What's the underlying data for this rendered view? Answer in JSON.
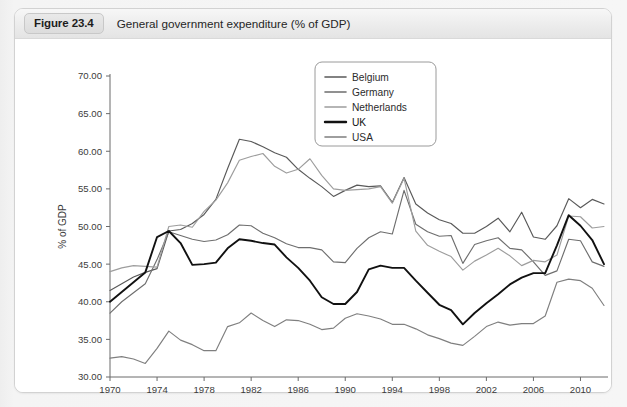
{
  "figure": {
    "number_label": "Figure 23.4",
    "title": "General government expenditure (% of GDP)"
  },
  "chart_data": {
    "type": "line",
    "title": "General government expenditure (% of GDP)",
    "xlabel": "",
    "ylabel": "% of GDP",
    "ylim": [
      30.0,
      70.0
    ],
    "xlim": [
      1970,
      2012
    ],
    "ytick_step": 5.0,
    "ytick_labels": [
      "30.00",
      "35.00",
      "40.00",
      "45.00",
      "50.00",
      "55.00",
      "60.00",
      "65.00",
      "70.00"
    ],
    "xtick_labels": [
      "1970",
      "1974",
      "1978",
      "1982",
      "1986",
      "1990",
      "1994",
      "1998",
      "2002",
      "2006",
      "2010"
    ],
    "xticks": [
      1970,
      1974,
      1978,
      1982,
      1986,
      1990,
      1994,
      1998,
      2002,
      2006,
      2010
    ],
    "grid": false,
    "legend_position": "top-right",
    "x": [
      1970,
      1971,
      1972,
      1973,
      1974,
      1975,
      1976,
      1977,
      1978,
      1979,
      1980,
      1981,
      1982,
      1983,
      1984,
      1985,
      1986,
      1987,
      1988,
      1989,
      1990,
      1991,
      1992,
      1993,
      1994,
      1995,
      1996,
      1997,
      1998,
      1999,
      2000,
      2001,
      2002,
      2003,
      2004,
      2005,
      2006,
      2007,
      2008,
      2009,
      2010,
      2011,
      2012
    ],
    "series": [
      {
        "name": "Belgium",
        "color": "#595959",
        "width": 1.15,
        "values": [
          41.5,
          42.4,
          43.3,
          43.9,
          44.4,
          49.4,
          49.6,
          50.4,
          51.6,
          53.6,
          57.7,
          61.6,
          61.3,
          60.6,
          59.8,
          59.2,
          57.6,
          56.4,
          55.3,
          54.0,
          54.8,
          55.5,
          55.3,
          55.4,
          53.2,
          56.5,
          53.0,
          51.8,
          50.9,
          50.4,
          49.1,
          49.1,
          50.0,
          51.1,
          49.3,
          51.9,
          48.6,
          48.3,
          50.1,
          53.7,
          52.5,
          53.6,
          53.0
        ]
      },
      {
        "name": "Germany",
        "color": "#6e6e6e",
        "width": 1.15,
        "values": [
          38.5,
          40.0,
          41.2,
          42.4,
          45.6,
          49.3,
          48.8,
          48.3,
          48.0,
          48.2,
          48.9,
          50.2,
          50.1,
          49.1,
          48.5,
          47.7,
          47.2,
          47.2,
          46.9,
          45.3,
          45.2,
          47.1,
          48.5,
          49.3,
          49.0,
          54.8,
          50.3,
          49.3,
          48.7,
          48.8,
          45.1,
          47.6,
          48.1,
          48.5,
          47.1,
          46.9,
          45.3,
          43.5,
          44.1,
          48.3,
          48.1,
          45.3,
          44.7
        ]
      },
      {
        "name": "Netherlands",
        "color": "#9d9d9d",
        "width": 1.15,
        "values": [
          44.0,
          44.5,
          44.8,
          44.7,
          44.6,
          50.0,
          50.2,
          49.9,
          52.0,
          53.5,
          55.8,
          58.8,
          59.3,
          59.7,
          58.0,
          57.1,
          57.6,
          59.0,
          56.8,
          55.0,
          54.8,
          54.9,
          55.0,
          55.3,
          53.1,
          56.4,
          49.4,
          47.5,
          46.7,
          46.0,
          44.2,
          45.4,
          46.2,
          47.1,
          46.1,
          44.8,
          45.5,
          45.3,
          46.2,
          51.4,
          51.3,
          49.8,
          50.0
        ]
      },
      {
        "name": "UK",
        "color": "#111111",
        "width": 1.9,
        "values": [
          40.0,
          41.3,
          42.6,
          43.9,
          48.6,
          49.4,
          47.8,
          44.9,
          45.0,
          45.2,
          47.1,
          48.3,
          48.1,
          47.8,
          47.6,
          45.9,
          44.5,
          42.8,
          40.6,
          39.7,
          39.7,
          41.3,
          44.3,
          44.8,
          44.5,
          44.5,
          42.8,
          41.2,
          39.6,
          38.9,
          37.0,
          38.5,
          39.8,
          41.0,
          42.3,
          43.2,
          43.8,
          43.8,
          47.5,
          51.5,
          50.1,
          48.2,
          45.0
        ]
      },
      {
        "name": "USA",
        "color": "#7f7f7f",
        "width": 1.15,
        "values": [
          32.5,
          32.7,
          32.4,
          31.8,
          33.8,
          36.1,
          34.9,
          34.3,
          33.5,
          33.5,
          36.7,
          37.2,
          38.5,
          37.5,
          36.7,
          37.6,
          37.5,
          37.0,
          36.3,
          36.5,
          37.8,
          38.4,
          38.1,
          37.7,
          37.0,
          37.0,
          36.4,
          35.6,
          35.1,
          34.5,
          34.2,
          35.4,
          36.7,
          37.3,
          36.9,
          37.1,
          37.1,
          38.1,
          42.6,
          43.0,
          42.8,
          41.8,
          39.5
        ]
      }
    ]
  },
  "legend": {
    "entries": [
      {
        "label": "Belgium"
      },
      {
        "label": "Germany"
      },
      {
        "label": "Netherlands"
      },
      {
        "label": "UK"
      },
      {
        "label": "USA"
      }
    ]
  }
}
